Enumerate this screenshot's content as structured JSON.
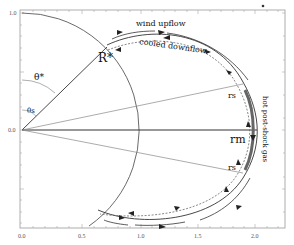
{
  "diagram": {
    "type": "magnetospheric accretion geometry",
    "labels": {
      "stellar_radius": "R*",
      "theta_star": "θ*",
      "theta_s": "θs",
      "r_m": "rm",
      "r_s_upper": "rs",
      "r_s_lower": "rs",
      "wind_upflow": "wind upflow",
      "cooled_downflow": "cooled downflow",
      "hot_gas": "hot post-shock gas"
    },
    "axes": {
      "x_ticks": [
        "0.0",
        "0.5",
        "1.0",
        "1.5",
        "2.0"
      ],
      "y_ticks": [
        "1.0",
        "0.0"
      ]
    },
    "colors": {
      "line": "#333333",
      "thin_line": "#777777",
      "hot_gas_band": "#666666",
      "label_gray": "#666666"
    }
  }
}
